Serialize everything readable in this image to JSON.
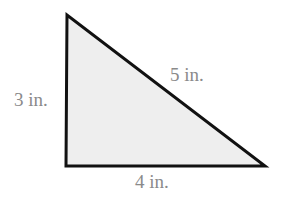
{
  "diagram": {
    "type": "right-triangle",
    "fill_color": "#eeeeee",
    "stroke_color": "#111111",
    "label_color": "#8a8a8a",
    "vertices": {
      "top": [
        67,
        15
      ],
      "bottom_left": [
        66,
        166
      ],
      "bottom_right": [
        265,
        166
      ]
    },
    "sides": {
      "left": {
        "label": "3 in."
      },
      "hypotenuse": {
        "label": "5 in."
      },
      "bottom": {
        "label": "4 in."
      }
    }
  }
}
